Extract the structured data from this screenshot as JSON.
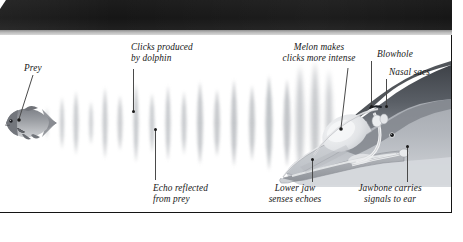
{
  "figure": {
    "title_banner": "",
    "colors": {
      "banner": "#1a1a1a",
      "banner_strip": "#b9b9b9",
      "panel_border": "#141414",
      "label_text": "#171717",
      "leader_line": "#4a4a4a",
      "leader_dot": "#1b1b1b",
      "background": "#ffffff",
      "dolphin_back": "#4e5258",
      "dolphin_body": "#8d9199",
      "dolphin_light": "#c9ccd1",
      "melon": "#e6e8ea",
      "wave": "#b8bcc0",
      "fish_body": "#8a8d92",
      "fish_dark": "#5a5d62"
    }
  },
  "labels": {
    "prey": {
      "text": "Prey",
      "lines": [
        "Prey"
      ]
    },
    "clicks_produced": {
      "text": "Clicks produced by dolphin",
      "lines": [
        "Clicks produced",
        "by dolphin"
      ]
    },
    "echo_reflected": {
      "text": "Echo reflected from prey",
      "lines": [
        "Echo reflected",
        "from prey"
      ]
    },
    "melon": {
      "text": "Melon makes clicks more intense",
      "lines": [
        "Melon makes",
        "clicks more intense"
      ]
    },
    "blowhole": {
      "text": "Blowhole",
      "lines": [
        "Blowhole"
      ]
    },
    "nasal_sacs": {
      "text": "Nasal sacs",
      "lines": [
        "Nasal sacs"
      ]
    },
    "lower_jaw": {
      "text": "Lower jaw senses echoes",
      "lines": [
        "Lower jaw",
        "senses echoes"
      ]
    },
    "jawbone": {
      "text": "Jawbone carries signals to ear",
      "lines": [
        "Jawbone carries",
        "signals to ear"
      ]
    }
  }
}
